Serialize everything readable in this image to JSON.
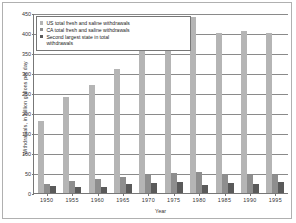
{
  "chart_data": {
    "type": "bar",
    "title": "",
    "xlabel": "Year",
    "ylabel": "Withdrawals, in billion gallons per day",
    "categories": [
      "1950",
      "1955",
      "1960",
      "1965",
      "1970",
      "1975",
      "1980",
      "1985",
      "1990",
      "1995"
    ],
    "ylim": [
      0,
      450
    ],
    "yticks": [
      0,
      50,
      100,
      150,
      200,
      250,
      300,
      350,
      400,
      450
    ],
    "ytick_labels": [
      "0",
      "50",
      "100",
      "150",
      "200",
      "250",
      "300",
      "350",
      "400",
      "450"
    ],
    "grid": true,
    "legend_position": "top-left-inside",
    "series": [
      {
        "name": "US total fresh and saline withdrawals",
        "color": "#b5b5b5",
        "values": [
          180,
          240,
          270,
          310,
          370,
          420,
          440,
          400,
          405,
          400
        ]
      },
      {
        "name": "CA total fresh and saline withdrawals",
        "color": "#8e8e8e",
        "values": [
          23,
          29,
          34,
          39,
          44,
          49,
          53,
          48,
          44,
          44
        ]
      },
      {
        "name": "Second largest state in total withdrawals",
        "color": "#5a5a5a",
        "values": [
          17,
          15,
          15,
          23,
          26,
          28,
          20,
          24,
          23,
          27
        ]
      }
    ]
  },
  "legend": {
    "items": [
      "US total fresh and saline withdrawals",
      "CA total fresh and saline withdrawals",
      "Second largest state in total\nwithdrawals"
    ]
  }
}
